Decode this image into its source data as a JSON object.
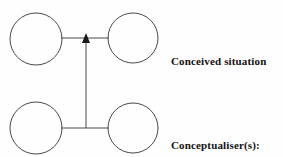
{
  "diagram": {
    "background_color": "#fefefe",
    "stroke_color": "#4a4a4a",
    "text_color": "#121212",
    "nodes": [
      {
        "id": "top-left",
        "name": "circle-top-left",
        "cx": 36,
        "cy": 39,
        "r": 26
      },
      {
        "id": "top-right",
        "name": "circle-top-right",
        "cx": 133,
        "cy": 38,
        "r": 25
      },
      {
        "id": "bottom-left",
        "name": "circle-bottom-left",
        "cx": 36,
        "cy": 128,
        "r": 26
      },
      {
        "id": "bottom-right",
        "name": "circle-bottom-right",
        "cx": 133,
        "cy": 128,
        "r": 25
      }
    ],
    "connectors": [
      {
        "name": "top-horizontal-connector",
        "x1": 62,
        "y1": 38,
        "x2": 108,
        "y2": 38
      },
      {
        "name": "bottom-horizontal-connector",
        "x1": 62,
        "y1": 128,
        "x2": 108,
        "y2": 128
      },
      {
        "name": "vertical-arrow-connector",
        "x1": 86,
        "y1": 128,
        "x2": 86,
        "y2": 40,
        "arrow": "up"
      }
    ],
    "arrowhead": {
      "name": "arrowhead-up-icon",
      "tip_x": 86,
      "tip_y": 36,
      "half_width": 4,
      "height": 8,
      "fill": "#1a1a1a"
    }
  },
  "labels": {
    "conceived_situation": "Conceived situation",
    "conceptualiser_line1": "Conceptualiser(s):",
    "conceptualiser_line2": "writer and reader"
  }
}
